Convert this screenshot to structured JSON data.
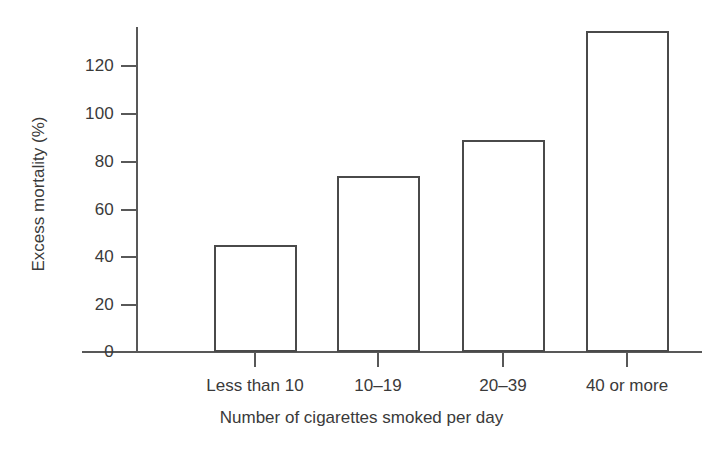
{
  "chart_data": {
    "type": "bar",
    "title": "",
    "xlabel": "Number of cigarettes smoked per day",
    "ylabel": "Excess mortality (%)",
    "categories": [
      "Less than 10",
      "10–19",
      "20–39",
      "40 or more"
    ],
    "values": [
      45,
      74,
      89,
      135
    ],
    "ylim": [
      0,
      140
    ],
    "yticks": [
      0,
      20,
      40,
      60,
      80,
      100,
      120
    ],
    "ytick_labels": [
      "0",
      "20",
      "40",
      "60",
      "80",
      "100",
      "120"
    ],
    "grid": false,
    "legend": "none",
    "series": [
      {
        "name": "Excess mortality (%)",
        "values": [
          45,
          74,
          89,
          135
        ]
      }
    ]
  },
  "axes": {
    "y_title": "Excess mortality (%)",
    "x_title": "Number of cigarettes smoked per day"
  },
  "colors": {
    "bar_fill": "#ffffff",
    "bar_stroke": "#4a4a4a",
    "axis": "#585858",
    "text": "#3a3a3a",
    "background": "#ffffff"
  }
}
